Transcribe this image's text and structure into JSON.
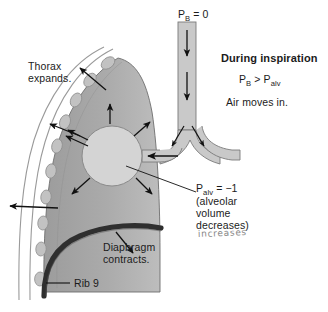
{
  "figure": {
    "width": 328,
    "height": 312,
    "background": "#ffffff"
  },
  "labels": {
    "barometric_pressure": "P",
    "barometric_pressure_sub": "B",
    "barometric_pressure_value": " = 0",
    "heading": "During inspiration",
    "pressure_relation_p1": "P",
    "pressure_relation_sub1": "B",
    "pressure_relation_mid": " > P",
    "pressure_relation_sub2": "alv",
    "air_direction": "Air moves in.",
    "thorax_line1": "Thorax",
    "thorax_line2": "expands.",
    "diaphragm_line1": "Diaphragm",
    "diaphragm_line2": "contracts.",
    "rib_label": "Rib 9",
    "alveolar_p": "P",
    "alveolar_p_sub": "alv",
    "alveolar_p_value": " = −1",
    "alveolar_note_line1": "(alveolar",
    "alveolar_note_line2": "volume",
    "alveolar_note_line3": "decreases)",
    "handwritten_correction": "increases"
  },
  "colors": {
    "lung_fill": "#a6a6a6",
    "lung_fill_light": "#b4b4b4",
    "lung_edge": "#6e6e6e",
    "alveolus_fill": "#d4d4d4",
    "alveolus_edge": "#8a8a8a",
    "rib_fill": "#c2c2c2",
    "rib_edge": "#8f8f8f",
    "chest_wall_line": "#9a9a9a",
    "diaphragm": "#2f2f2f",
    "airway_fill": "#c9c9c9",
    "airway_edge": "#7a7a7a",
    "arrow": "#111111",
    "text": "#1b1b1b",
    "handwriting": "#7d7d7d",
    "background": "#ffffff"
  },
  "anatomy": {
    "structures": [
      "trachea",
      "bronchial-bifurcation",
      "bronchus",
      "alveolus",
      "lung",
      "pleural-space",
      "chest-wall",
      "ribs",
      "diaphragm"
    ],
    "rib_count": 10
  },
  "arrows": {
    "airflow_trachea_count": 2,
    "airflow_bronchi_count": 2,
    "airflow_into_alveolus": 1,
    "alveolar_expansion_count": 5,
    "thoracic_expansion_count": 4,
    "diaphragm_descent_count": 1
  }
}
